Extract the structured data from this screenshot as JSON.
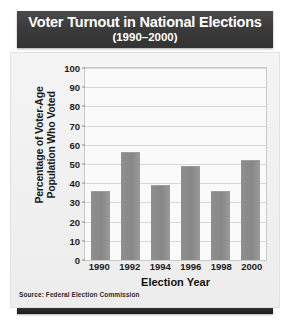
{
  "chart_data": {
    "type": "bar",
    "title": "Voter Turnout in National Elections",
    "subtitle": "(1990–2000)",
    "categories": [
      "1990",
      "1992",
      "1994",
      "1996",
      "1998",
      "2000"
    ],
    "values": [
      36,
      56,
      39,
      49,
      36,
      52
    ],
    "xlabel": "Election Year",
    "ylabel_line1": "Percentage of Voter-Age",
    "ylabel_line2": "Population Who Voted",
    "ylim": [
      0,
      100
    ],
    "yticks": [
      100,
      90,
      80,
      70,
      60,
      50,
      40,
      30,
      20,
      10,
      0
    ],
    "ytick_labels": [
      "100",
      "90",
      "80",
      "70",
      "60",
      "50",
      "40",
      "30",
      "20",
      "10",
      "0"
    ],
    "grid": true,
    "legend": "none",
    "source_note": "Source: Federal Election Commission",
    "colors": {
      "bar": "#8a8a8a",
      "title_band": "#383838",
      "title_text": "#ffffff",
      "plot_background": "#fafafa",
      "card_background": "#f0f0f0",
      "gridline": "#d8d8d8",
      "axis": "#c9c9c9",
      "footer_bar": "#232323"
    }
  }
}
